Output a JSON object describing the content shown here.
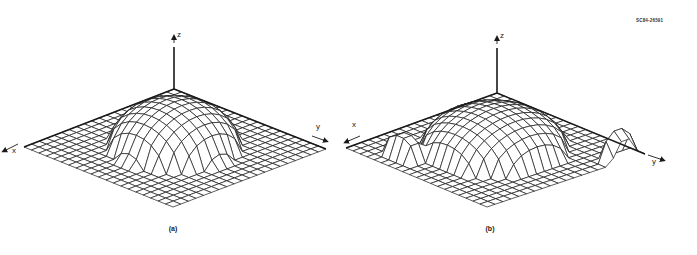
{
  "figure_code": "SC84-26591",
  "panels": [
    {
      "id": "a",
      "caption": "(a)",
      "caption_pos": [
        173,
        229
      ],
      "grid_cells": 20,
      "corners": {
        "top": [
          174,
          89
        ],
        "left": [
          24,
          147
        ],
        "right": [
          326,
          149
        ],
        "bottom": [
          173,
          207
        ]
      },
      "z_axis": {
        "from": [
          174,
          89
        ],
        "to": [
          174,
          33
        ],
        "label": "z",
        "label_pos": [
          178,
          36
        ]
      },
      "x_axis": {
        "label": "x",
        "label_pos": [
          12,
          148
        ],
        "arrow_from": [
          18,
          144
        ],
        "arrow_to": [
          4,
          151
        ]
      },
      "y_axis": {
        "label": "y",
        "label_pos": [
          316,
          126
        ],
        "arrow_from": [
          312,
          136
        ],
        "arrow_to": [
          326,
          141
        ]
      },
      "dome": {
        "center": [
          10,
          10
        ],
        "radius": 6.2,
        "height": 46,
        "shape": "smooth"
      },
      "bumps": []
    },
    {
      "id": "b",
      "caption": "(b)",
      "caption_pos": [
        490,
        229
      ],
      "grid_cells": 20,
      "corners": {
        "top": [
          497,
          93
        ],
        "left": [
          346,
          148
        ],
        "right": [
          645,
          154
        ],
        "bottom": [
          487,
          207
        ]
      },
      "z_axis": {
        "from": [
          497,
          93
        ],
        "to": [
          497,
          34
        ],
        "label": "z",
        "label_pos": [
          500,
          38
        ]
      },
      "x_axis": {
        "label": "x",
        "label_pos": [
          352,
          124
        ],
        "arrow_from": [
          360,
          136
        ],
        "arrow_to": [
          346,
          142
        ]
      },
      "y_axis": {
        "label": "y",
        "label_pos": [
          653,
          158
        ],
        "arrow_from": [
          648,
          155
        ],
        "arrow_to": [
          663,
          160
        ]
      },
      "dome": {
        "center": [
          10,
          10
        ],
        "radius": 7,
        "height": 42,
        "shape": "faceted"
      },
      "bumps": [
        {
          "center": [
            17.5,
            5.5
          ],
          "rx": 1.4,
          "ry": 2.5,
          "height": 24
        },
        {
          "center": [
            2.5,
            19.3
          ],
          "rx": 2.2,
          "ry": 1.0,
          "height": 30
        }
      ]
    }
  ],
  "line_color": "#1a1a1a"
}
